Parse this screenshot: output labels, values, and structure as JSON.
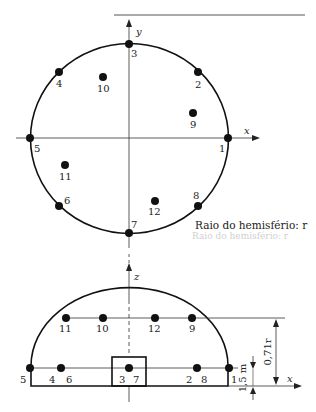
{
  "diagram": {
    "type": "measurement-points-hemisphere",
    "caption": "Raio do hemisfério: r",
    "caption_ghost": "Raio do hemisfério: r",
    "plan_view": {
      "axes": {
        "x_label": "x",
        "y_label": "y"
      },
      "points": [
        {
          "id": "1",
          "label": "1"
        },
        {
          "id": "2",
          "label": "2"
        },
        {
          "id": "3",
          "label": "3"
        },
        {
          "id": "4",
          "label": "4"
        },
        {
          "id": "5",
          "label": "5"
        },
        {
          "id": "6",
          "label": "6"
        },
        {
          "id": "7",
          "label": "7"
        },
        {
          "id": "8",
          "label": "8"
        },
        {
          "id": "9",
          "label": "9"
        },
        {
          "id": "10",
          "label": "10"
        },
        {
          "id": "11",
          "label": "11"
        },
        {
          "id": "12",
          "label": "12"
        }
      ]
    },
    "elevation_view": {
      "axes": {
        "x_label": "x",
        "z_label": "z"
      },
      "upper_row_labels": [
        "11",
        "10",
        "12",
        "9"
      ],
      "lower_row_labels": [
        "5",
        "4",
        "6",
        "3",
        "7",
        "2",
        "8",
        "1"
      ],
      "dimensions": {
        "upper_height": "0,71r",
        "lower_height": "1,5 m"
      }
    }
  }
}
